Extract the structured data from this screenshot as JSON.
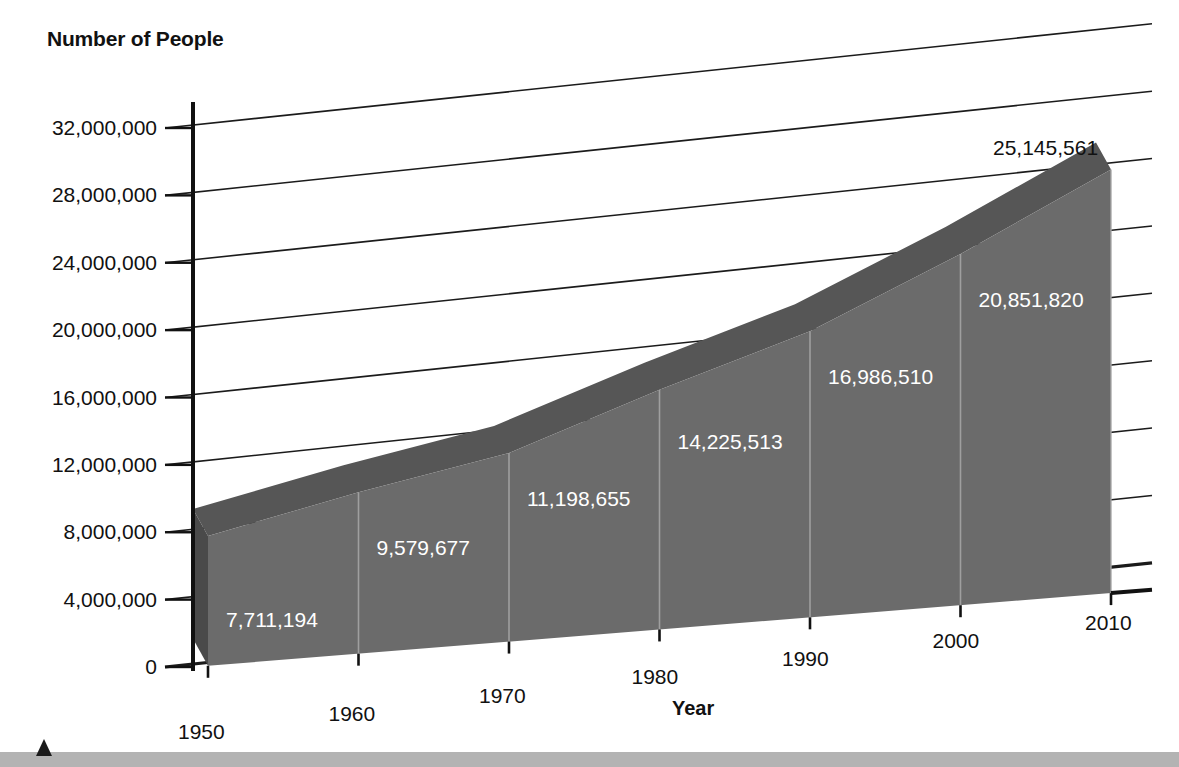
{
  "chart_data": {
    "type": "area",
    "title": "",
    "ylabel": "Number of People",
    "xlabel": "Year",
    "categories": [
      "1950",
      "1960",
      "1970",
      "1980",
      "1990",
      "2000",
      "2010"
    ],
    "values": [
      7711194,
      9579677,
      11198655,
      14225513,
      16986510,
      20851820,
      25145561
    ],
    "value_labels": [
      "7,711,194",
      "9,579,677",
      "11,198,655",
      "14,225,513",
      "16,986,510",
      "20,851,820",
      "25,145,561"
    ],
    "ylim": [
      0,
      32000000
    ],
    "ytick_labels": [
      "0",
      "4,000,000",
      "8,000,000",
      "12,000,000",
      "16,000,000",
      "20,000,000",
      "24,000,000",
      "28,000,000",
      "32,000,000"
    ],
    "ytick_values": [
      0,
      4000000,
      8000000,
      12000000,
      16000000,
      20000000,
      24000000,
      28000000,
      32000000
    ],
    "grid": true,
    "legend": "none",
    "style": "3d-perspective-area",
    "colors": {
      "front_face": "#6b6b6b",
      "top_ridge": "#565656",
      "side_face": "#4a4a4a",
      "gridline": "#1b1b1b",
      "axis": "#111111",
      "value_label": "#ffffff",
      "outer_value_label": "#111111",
      "background": "#ffffff",
      "footer_band": "#b3b3b3",
      "footer_marker": "#1b1b1b"
    }
  }
}
